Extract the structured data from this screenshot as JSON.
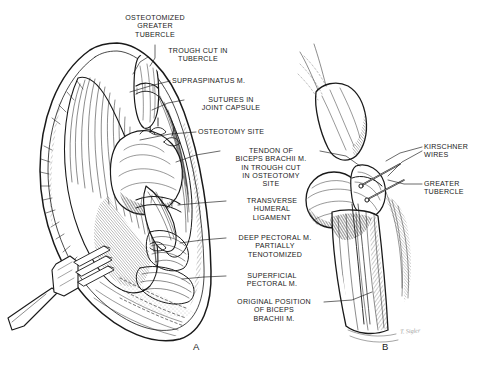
{
  "figure": {
    "background_color": "#ffffff",
    "ink_color": "#1a1a1a",
    "width": 484,
    "height": 369
  },
  "panels": [
    {
      "letter": "A",
      "x": 193,
      "y": 341
    },
    {
      "letter": "B",
      "x": 382,
      "y": 341
    }
  ],
  "labels": [
    {
      "name": "osteotomized-greater-tubercle",
      "lines": [
        "OSTEOTOMIZED",
        "GREATER",
        "TUBERCLE"
      ],
      "x": 104,
      "y": 14,
      "w": 102,
      "align": "center",
      "leader": [
        [
          155,
          45
        ],
        [
          155,
          58
        ],
        [
          150,
          66
        ]
      ]
    },
    {
      "name": "trough-cut-in-tubercle",
      "lines": [
        "TROUGH CUT IN",
        "TUBERCLE"
      ],
      "x": 150,
      "y": 47,
      "w": 96,
      "align": "center",
      "leader": [
        [
          148,
          57
        ],
        [
          140,
          62
        ],
        [
          133,
          74
        ]
      ]
    },
    {
      "name": "supraspinatus-m",
      "lines": [
        "SUPRASPINATUS M."
      ],
      "x": 172,
      "y": 77,
      "w": 92,
      "align": "left",
      "leader": [
        [
          170,
          81
        ],
        [
          150,
          86
        ],
        [
          130,
          92
        ]
      ]
    },
    {
      "name": "sutures-in-joint-capsule",
      "lines": [
        "SUTURES IN",
        "JOINT CAPSULE"
      ],
      "x": 186,
      "y": 96,
      "w": 90,
      "align": "center",
      "leader": [
        [
          184,
          100
        ],
        [
          168,
          103
        ],
        [
          152,
          110
        ]
      ]
    },
    {
      "name": "osteotomy-site",
      "lines": [
        "OSTEOTOMY SITE"
      ],
      "x": 198,
      "y": 128,
      "w": 86,
      "align": "left",
      "leader": [
        [
          196,
          132
        ],
        [
          170,
          134
        ],
        [
          140,
          140
        ]
      ]
    },
    {
      "name": "tendon-of-biceps-brachii-m",
      "lines": [
        "TENDON OF",
        "BICEPS BRACHII M.",
        "IN TROUGH CUT",
        "IN OSTEOTOMY",
        "SITE"
      ],
      "x": 222,
      "y": 147,
      "w": 98,
      "align": "center",
      "leader": [
        [
          220,
          151
        ],
        [
          196,
          155
        ],
        [
          176,
          162
        ]
      ],
      "leader2": [
        [
          320,
          151
        ],
        [
          346,
          156
        ],
        [
          360,
          166
        ]
      ]
    },
    {
      "name": "transverse-humeral-ligament",
      "lines": [
        "TRANSVERSE",
        "HUMERAL",
        "LIGAMENT"
      ],
      "x": 228,
      "y": 197,
      "w": 88,
      "align": "center",
      "leader": [
        [
          226,
          201
        ],
        [
          200,
          203
        ],
        [
          178,
          205
        ]
      ]
    },
    {
      "name": "deep-pectoral-m-partially-tenotomized",
      "lines": [
        "DEEP PECTORAL M.",
        "PARTIALLY",
        "TENOTOMIZED"
      ],
      "x": 228,
      "y": 234,
      "w": 94,
      "align": "center",
      "leader": [
        [
          226,
          238
        ],
        [
          202,
          240
        ],
        [
          180,
          243
        ]
      ]
    },
    {
      "name": "superficial-pectoral-m",
      "lines": [
        "SUPERFICIAL",
        "PECTORAL M."
      ],
      "x": 228,
      "y": 272,
      "w": 88,
      "align": "center",
      "leader": [
        [
          226,
          276
        ],
        [
          204,
          277
        ],
        [
          182,
          279
        ]
      ]
    },
    {
      "name": "original-position-of-biceps-brachii-m",
      "lines": [
        "ORIGINAL POSITION",
        "OF BICEPS",
        "BRACHII M."
      ],
      "x": 224,
      "y": 298,
      "w": 100,
      "align": "center",
      "leader": [
        [
          324,
          302
        ],
        [
          352,
          300
        ],
        [
          372,
          292
        ]
      ]
    },
    {
      "name": "kirschner-wires",
      "lines": [
        "KIRSCHNER",
        "WIRES"
      ],
      "x": 424,
      "y": 143,
      "w": 60,
      "align": "left",
      "leader": [
        [
          422,
          147
        ],
        [
          400,
          153
        ],
        [
          386,
          161
        ]
      ],
      "leader2": [
        [
          422,
          151
        ],
        [
          402,
          162
        ],
        [
          388,
          176
        ]
      ]
    },
    {
      "name": "greater-tubercle-right",
      "lines": [
        "GREATER",
        "TUBERCLE"
      ],
      "x": 424,
      "y": 180,
      "w": 60,
      "align": "left",
      "leader": [
        [
          422,
          184
        ],
        [
          404,
          184
        ],
        [
          388,
          180
        ]
      ]
    }
  ],
  "signature": {
    "text": "T. Sigler",
    "x": 400,
    "y": 328
  }
}
